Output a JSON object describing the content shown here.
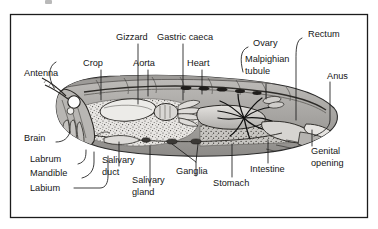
{
  "figure": {
    "frame_color": "#1c1c1c",
    "background_color": "#ffffff",
    "label_color": "#161616",
    "leader_color": "#1a1a1a",
    "body_fill_color": "#b0aeab",
    "body_outline_color": "#2b2b2b",
    "stipple_color": "#4a4845",
    "brain_fill_color": "#fdfdfd",
    "tubule_color": "#101010"
  },
  "labels": {
    "antenna": "Antenna",
    "crop": "Crop",
    "gizzard": "Gizzard",
    "aorta": "Aorta",
    "gastric_caeca": "Gastric caeca",
    "heart": "Heart",
    "ovary": "Ovary",
    "malpighian_line1": "Malpighian",
    "malpighian_line2": "tubule",
    "rectum": "Rectum",
    "anus": "Anus",
    "genital_line1": "Genital",
    "genital_line2": "opening",
    "intestine": "Intestine",
    "stomach": "Stomach",
    "ganglia": "Ganglia",
    "salivary_gland_line1": "Salivary",
    "salivary_gland_line2": "gland",
    "salivary_duct_line1": "Salivary",
    "salivary_duct_line2": "duct",
    "labium": "Labium",
    "mandible": "Mandible",
    "labrum": "Labrum",
    "brain": "Brain"
  }
}
